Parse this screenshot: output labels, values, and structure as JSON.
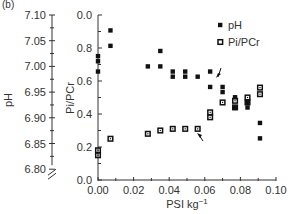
{
  "panel_label": "(b)",
  "legend": [
    {
      "label": "pH",
      "marker": "filled-square"
    },
    {
      "label": "Pi/PCr",
      "marker": "open-square"
    }
  ],
  "axes": {
    "x": {
      "label": "PSI kg",
      "label_superscript": "−1",
      "ticks": [
        "0.00",
        "0.02",
        "0.04",
        "0.06",
        "0.08",
        "0.10"
      ],
      "range": [
        0,
        0.1
      ]
    },
    "y_left": {
      "label": "pH",
      "ticks": [
        "7.10",
        "7.05",
        "7.00",
        "6.95",
        "6.90",
        "6.85",
        "6.80"
      ],
      "range": [
        6.8,
        7.1
      ],
      "axis_break": true
    },
    "y_right": {
      "label": "Pi/PCr",
      "ticks": [
        "0.0",
        "0.8",
        "0.6",
        "0.4",
        "0.2",
        "0.0"
      ],
      "range": [
        0,
        1.0
      ]
    }
  },
  "chart_data": {
    "type": "scatter",
    "title": "",
    "xlabel": "PSI kg−1",
    "ylabel": "pH",
    "y2label": "Pi/PCr",
    "xlim": [
      0,
      0.1
    ],
    "ylim": [
      6.8,
      7.1
    ],
    "y2lim": [
      0,
      1.0
    ],
    "legend_position": "upper right",
    "annotations": [
      "arrow near x≈0.065 pointing to pH series",
      "arrow near x≈0.060 pointing to Pi/PCr series"
    ],
    "series": [
      {
        "name": "pH",
        "axis": "left",
        "marker": "filled-square",
        "points": [
          [
            0.0,
            7.02
          ],
          [
            0.0,
            7.01
          ],
          [
            0.0,
            6.99
          ],
          [
            0.007,
            7.07
          ],
          [
            0.007,
            7.04
          ],
          [
            0.028,
            7.0
          ],
          [
            0.035,
            7.03
          ],
          [
            0.035,
            7.0
          ],
          [
            0.042,
            6.99
          ],
          [
            0.042,
            6.98
          ],
          [
            0.049,
            6.99
          ],
          [
            0.049,
            6.98
          ],
          [
            0.056,
            6.98
          ],
          [
            0.063,
            6.99
          ],
          [
            0.063,
            6.96
          ],
          [
            0.07,
            6.96
          ],
          [
            0.07,
            6.95
          ],
          [
            0.077,
            6.94
          ],
          [
            0.077,
            6.92
          ],
          [
            0.084,
            6.93
          ],
          [
            0.084,
            6.92
          ],
          [
            0.091,
            6.89
          ],
          [
            0.091,
            6.86
          ]
        ]
      },
      {
        "name": "Pi/PCr",
        "axis": "right",
        "marker": "open-square",
        "points": [
          [
            0.0,
            0.18
          ],
          [
            0.0,
            0.15
          ],
          [
            0.007,
            0.25
          ],
          [
            0.028,
            0.28
          ],
          [
            0.035,
            0.3
          ],
          [
            0.042,
            0.31
          ],
          [
            0.049,
            0.31
          ],
          [
            0.056,
            0.31
          ],
          [
            0.063,
            0.41
          ],
          [
            0.063,
            0.38
          ],
          [
            0.07,
            0.47
          ],
          [
            0.077,
            0.48
          ],
          [
            0.077,
            0.44
          ],
          [
            0.084,
            0.5
          ],
          [
            0.084,
            0.47
          ],
          [
            0.091,
            0.56
          ],
          [
            0.091,
            0.52
          ]
        ]
      }
    ]
  },
  "colors": {
    "marker": "#111111",
    "axis": "#333333",
    "text": "#333333"
  }
}
